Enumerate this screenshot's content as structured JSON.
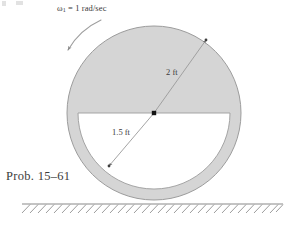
{
  "figure": {
    "caption": "Prob. 15–61",
    "angular_velocity_label": "ω",
    "angular_velocity_subscript": "1",
    "angular_velocity_value": " = 1 rad/sec",
    "outer_radius_label": "2 ft",
    "inner_radius_label": "1.5 ft",
    "colors": {
      "body_fill": "#d5d5d5",
      "body_stroke": "#9a9a9a",
      "inner_fill": "#ffffff",
      "line_stroke": "#8f8f8f",
      "ground_stroke": "#8a8a8a",
      "text": "#3a3a3a",
      "center_dot": "#1a1a1a",
      "page_background": "#ffffff"
    }
  },
  "geometry": {
    "center_x": 154,
    "center_y": 113,
    "outer_radius_px": 87,
    "inner_radius_px": 76,
    "ground_y": 204,
    "outer_radius_ft": 2,
    "inner_radius_ft": 1.5,
    "omega_rad_per_sec": 1,
    "rotation_sense": "counterclockwise"
  },
  "annotations": {
    "outer_arrow_tip_x": 205,
    "outer_arrow_tip_y": 40,
    "inner_arrow_tip_x": 110,
    "inner_arrow_tip_y": 165
  }
}
